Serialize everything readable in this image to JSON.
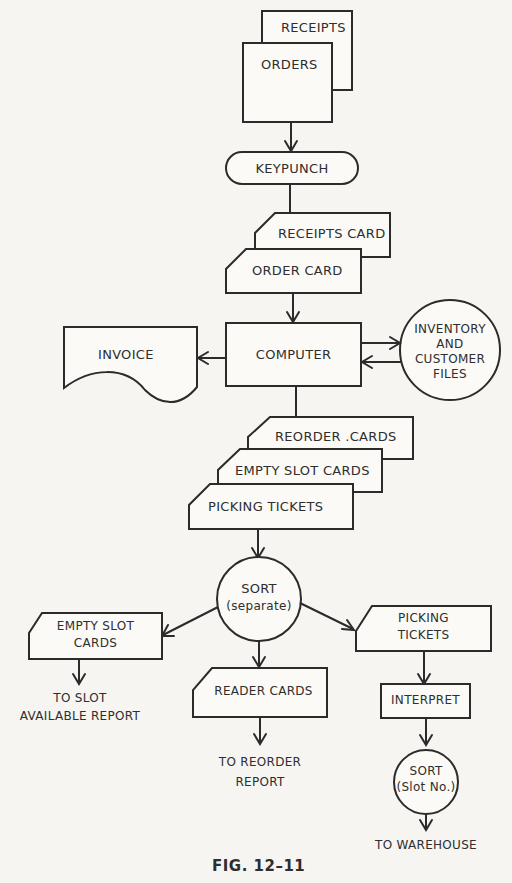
{
  "diagram": {
    "type": "flowchart",
    "caption": "FIG. 12–11",
    "nodes": {
      "receipts": "RECEIPTS",
      "orders": "ORDERS",
      "keypunch": "KEYPUNCH",
      "receipts_card": "RECEIPTS CARD",
      "order_card": "ORDER CARD",
      "computer": "COMPUTER",
      "invoice": "INVOICE",
      "files_line1": "INVENTORY",
      "files_line2": "AND",
      "files_line3": "CUSTOMER",
      "files_line4": "FILES",
      "reorder_cards": "REORDER .CARDS",
      "empty_slot_cards": "EMPTY SLOT CARDS",
      "picking_tickets": "PICKING TICKETS",
      "sort_title": "SORT",
      "sort_sub": "(separate)",
      "empty_slot_out_line1": "EMPTY SLOT",
      "empty_slot_out_line2": "CARDS",
      "reader_cards": "READER CARDS",
      "picking_out_line1": "PICKING",
      "picking_out_line2": "TICKETS",
      "interpret": "INTERPRET",
      "sort2_title": "SORT",
      "sort2_sub": "(Slot No.)"
    },
    "terminals": {
      "to_slot_line1": "TO SLOT",
      "to_slot_line2": "AVAILABLE REPORT",
      "to_reorder_line1": "TO REORDER",
      "to_reorder_line2": "REPORT",
      "to_warehouse": "TO WAREHOUSE"
    },
    "edges": [
      [
        "ORDERS",
        "KEYPUNCH"
      ],
      [
        "KEYPUNCH",
        "RECEIPTS CARD"
      ],
      [
        "ORDER CARD",
        "COMPUTER"
      ],
      [
        "COMPUTER",
        "INVOICE"
      ],
      [
        "COMPUTER",
        "INVENTORY AND CUSTOMER FILES"
      ],
      [
        "INVENTORY AND CUSTOMER FILES",
        "COMPUTER"
      ],
      [
        "COMPUTER",
        "REORDER .CARDS"
      ],
      [
        "PICKING TICKETS",
        "SORT (separate)"
      ],
      [
        "SORT (separate)",
        "EMPTY SLOT CARDS"
      ],
      [
        "SORT (separate)",
        "READER CARDS"
      ],
      [
        "SORT (separate)",
        "PICKING TICKETS"
      ],
      [
        "EMPTY SLOT CARDS",
        "TO SLOT AVAILABLE REPORT"
      ],
      [
        "READER CARDS",
        "TO REORDER REPORT"
      ],
      [
        "PICKING TICKETS",
        "INTERPRET"
      ],
      [
        "INTERPRET",
        "SORT (Slot No.)"
      ],
      [
        "SORT (Slot No.)",
        "TO WAREHOUSE"
      ]
    ]
  }
}
